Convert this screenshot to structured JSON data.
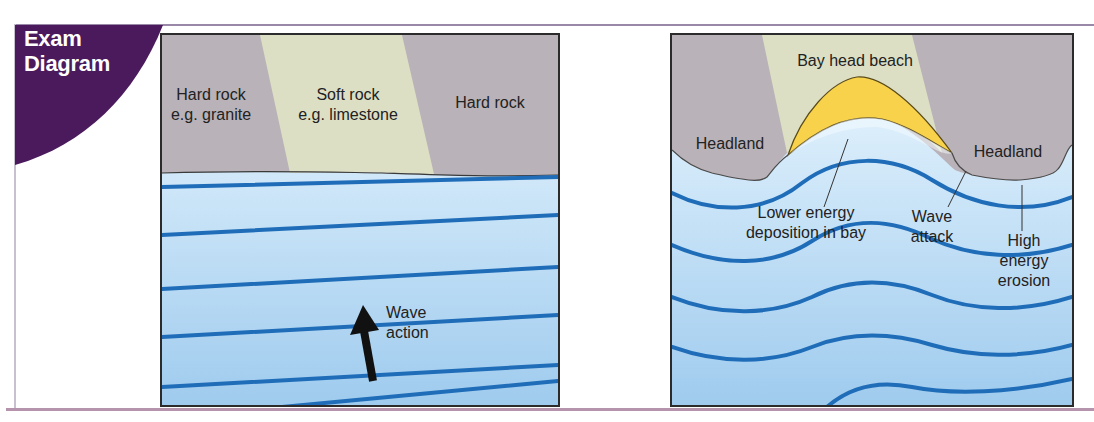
{
  "badge": {
    "line1": "Exam",
    "line2": "Diagram",
    "color": "#4a1a5c"
  },
  "colors": {
    "hard_rock": "#b9b2b8",
    "soft_rock": "#dcdfc4",
    "beach": "#f8d24a",
    "sea_top": "#f4fbff",
    "sea_bottom": "#9fcbee",
    "wave_line": "#1f6db8",
    "outline": "#2b2b2b"
  },
  "left_panel": {
    "labels": {
      "hard_rock_left_line1": "Hard rock",
      "hard_rock_left_line2": "e.g. granite",
      "soft_rock_line1": "Soft rock",
      "soft_rock_line2": "e.g. limestone",
      "hard_rock_right": "Hard rock",
      "wave_action_line1": "Wave",
      "wave_action_line2": "action"
    }
  },
  "right_panel": {
    "labels": {
      "bay_head_beach": "Bay head beach",
      "headland_left": "Headland",
      "headland_right": "Headland",
      "lower_energy_line1": "Lower energy",
      "lower_energy_line2": "deposition in bay",
      "wave_attack_line1": "Wave",
      "wave_attack_line2": "attack",
      "high_energy_line1": "High",
      "high_energy_line2": "energy",
      "high_energy_line3": "erosion"
    }
  }
}
